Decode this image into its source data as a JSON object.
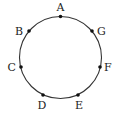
{
  "diagram": {
    "type": "circle-with-points",
    "circle": {
      "cx": 60.5,
      "cy": 57.5,
      "r": 41,
      "stroke": "#333333"
    },
    "points": [
      {
        "name": "A",
        "x": 60.5,
        "y": 16.5,
        "lx": 60.5,
        "ly": 11,
        "anchor": "middle"
      },
      {
        "name": "B",
        "x": 29,
        "y": 31,
        "lx": 23,
        "ly": 35,
        "anchor": "end"
      },
      {
        "name": "G",
        "x": 92,
        "y": 31,
        "lx": 97,
        "ly": 35,
        "anchor": "start"
      },
      {
        "name": "C",
        "x": 21,
        "y": 67,
        "lx": 16,
        "ly": 71,
        "anchor": "end"
      },
      {
        "name": "F",
        "x": 100,
        "y": 67,
        "lx": 104,
        "ly": 71,
        "anchor": "start"
      },
      {
        "name": "D",
        "x": 43,
        "y": 95,
        "lx": 42,
        "ly": 109,
        "anchor": "middle"
      },
      {
        "name": "E",
        "x": 78,
        "y": 95,
        "lx": 79,
        "ly": 109,
        "anchor": "middle"
      }
    ]
  }
}
